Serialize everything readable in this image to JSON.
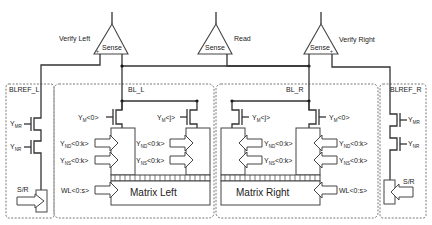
{
  "diagram": {
    "sense_amps": [
      {
        "id": "verify-left",
        "label": "Sense",
        "caption": "Verify Left"
      },
      {
        "id": "read",
        "label": "Sense",
        "caption": "Read"
      },
      {
        "id": "verify-right",
        "label": "Sense",
        "caption": "Verify Right"
      }
    ],
    "blocks": {
      "blref_l": "BLREF_L",
      "bl_l": "BL_L",
      "bl_r": "BL_R",
      "blref_r": "BLREF_R"
    },
    "matrices": {
      "left": "Matrix Left",
      "right": "Matrix Right"
    },
    "signals": {
      "y": "Y",
      "mr": "MR",
      "nr": "NR",
      "m": "M",
      "nd": "ND",
      "ns": "NS",
      "idx0": "<0>",
      "idxj": "<j>",
      "idx0k": "<0:k>",
      "wl": "WL<0:s>",
      "sr": "S/R"
    }
  }
}
